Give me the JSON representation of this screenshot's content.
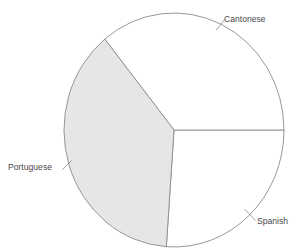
{
  "chart_data": {
    "type": "pie",
    "title": "",
    "subtitle": "",
    "xlabel": "",
    "ylabel": "",
    "legend_position": "none",
    "grid": false,
    "labels_position": "outside-with-leader-lines",
    "categories": [
      "Cantonese",
      "Portuguese",
      "Spanish"
    ],
    "values": [
      36,
      38,
      26
    ],
    "units": "percent",
    "slices": [
      {
        "label": "Cantonese",
        "value": 36,
        "start_angle_deg": 0,
        "end_angle_deg": 129,
        "fill": "#ffffff",
        "stroke": "#8c8c8c"
      },
      {
        "label": "Portuguese",
        "value": 38,
        "start_angle_deg": 129,
        "end_angle_deg": 266,
        "fill": "#e6e6e6",
        "stroke": "#8c8c8c"
      },
      {
        "label": "Spanish",
        "value": 26,
        "start_angle_deg": 266,
        "end_angle_deg": 360,
        "fill": "#ffffff",
        "stroke": "#8c8c8c"
      }
    ]
  },
  "chart": {
    "center_x": 174,
    "center_y": 130,
    "radius_x": 110,
    "radius_y": 117,
    "outline_color": "#8c8c8c",
    "background_color": "#ffffff",
    "shaded_slice_color": "#e6e6e6",
    "unshaded_slice_color": "#ffffff",
    "label_color": "#4a4a4a"
  },
  "labels": {
    "cantonese": {
      "text": "Cantonese",
      "x": 224,
      "y": 22
    },
    "portuguese": {
      "text": "Portuguese",
      "x": 8,
      "y": 170
    },
    "spanish": {
      "text": "Spanish",
      "x": 257,
      "y": 224
    }
  }
}
